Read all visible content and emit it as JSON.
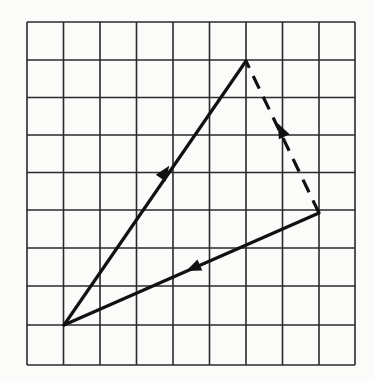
{
  "diagram": {
    "type": "vector-triangle-on-grid",
    "grid": {
      "columns": 9,
      "rows": 9,
      "x_lines": [
        27,
        63.5,
        100,
        136.5,
        173,
        209.5,
        246,
        282.5,
        319,
        355
      ],
      "y_lines": [
        22,
        60,
        97.5,
        135,
        172.5,
        210,
        248,
        286,
        325,
        365
      ],
      "line_color": "#2a2a2a"
    },
    "points": {
      "A": {
        "col": 1,
        "row": 8,
        "x": 64,
        "y": 325
      },
      "B": {
        "col": 6,
        "row": 1,
        "x": 246,
        "y": 61
      },
      "C": {
        "col": 8,
        "row": 5,
        "x": 319,
        "y": 213
      }
    },
    "vectors": [
      {
        "name": "A-to-B",
        "from": "A",
        "to": "B",
        "style": "solid",
        "arrow_at": [
          165,
          172
        ],
        "color": "#111111"
      },
      {
        "name": "C-to-B",
        "from": "C",
        "to": "B",
        "style": "dashed",
        "arrow_at": [
          281,
          130
        ],
        "color": "#111111"
      },
      {
        "name": "C-to-A",
        "from": "C",
        "to": "A",
        "style": "solid",
        "arrow_at": [
          193,
          268
        ],
        "color": "#111111"
      }
    ]
  }
}
